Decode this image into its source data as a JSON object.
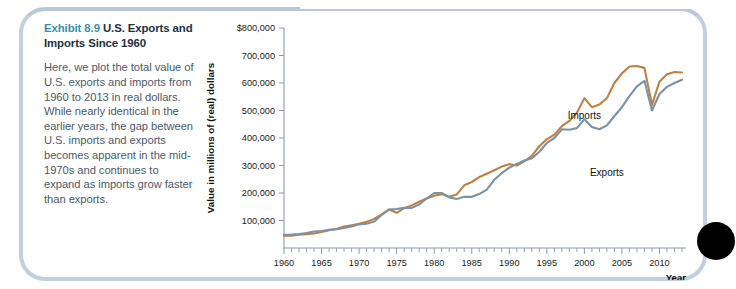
{
  "caption": {
    "exhibit_label": "Exhibit 8.9",
    "title": "U.S. Exports and Imports Since 1960",
    "body": "Here, we plot the total value of U.S. exports and imports from 1960 to 2013 in real dollars. While nearly identical in the earlier years, the gap between U.S. imports and exports becomes apparent in the mid-1970s and continues to expand as imports grow faster than exports.",
    "accent_color": "#3a8fa8"
  },
  "chart_data": {
    "type": "line",
    "title": "",
    "xlabel": "Year",
    "ylabel": "Value in millions of (real) dollars",
    "xlim": [
      1960,
      2013
    ],
    "ylim": [
      0,
      800000
    ],
    "grid": false,
    "legend": "inline-labels",
    "ytick_labels": [
      "$800,000",
      "700,000",
      "600,000",
      "500,000",
      "400,000",
      "300,000",
      "200,000",
      "100,000"
    ],
    "ytick_values": [
      800000,
      700000,
      600000,
      500000,
      400000,
      300000,
      200000,
      100000
    ],
    "xtick_labels": [
      "1960",
      "1965",
      "1970",
      "1975",
      "1980",
      "1985",
      "1990",
      "1995",
      "2000",
      "2005",
      "2010"
    ],
    "xtick_values": [
      1960,
      1965,
      1970,
      1975,
      1980,
      1985,
      1990,
      1995,
      2000,
      2005,
      2010
    ],
    "x": [
      1960,
      1961,
      1962,
      1963,
      1964,
      1965,
      1966,
      1967,
      1968,
      1969,
      1970,
      1971,
      1972,
      1973,
      1974,
      1975,
      1976,
      1977,
      1978,
      1979,
      1980,
      1981,
      1982,
      1983,
      1984,
      1985,
      1986,
      1987,
      1988,
      1989,
      1990,
      1991,
      1992,
      1993,
      1994,
      1995,
      1996,
      1997,
      1998,
      1999,
      2000,
      2001,
      2002,
      2003,
      2004,
      2005,
      2006,
      2007,
      2008,
      2009,
      2010,
      2011,
      2012,
      2013
    ],
    "series": [
      {
        "name": "Imports",
        "color": "#c2803f",
        "label_position": {
          "x": 2000,
          "y": 470000
        },
        "values": [
          45000,
          45000,
          48000,
          50000,
          53000,
          58000,
          65000,
          69000,
          78000,
          83000,
          88000,
          95000,
          106000,
          122000,
          140000,
          128000,
          145000,
          155000,
          168000,
          180000,
          190000,
          196000,
          186000,
          195000,
          228000,
          240000,
          258000,
          270000,
          283000,
          296000,
          305000,
          300000,
          315000,
          335000,
          370000,
          396000,
          412000,
          443000,
          462000,
          492000,
          545000,
          512000,
          522000,
          545000,
          600000,
          635000,
          660000,
          662000,
          655000,
          520000,
          605000,
          632000,
          640000,
          638000
        ]
      },
      {
        "name": "Exports",
        "color": "#7b92a8",
        "label_position": {
          "x": 2003,
          "y": 262000
        },
        "values": [
          48000,
          49000,
          51000,
          54000,
          60000,
          62000,
          66000,
          68000,
          73000,
          78000,
          86000,
          88000,
          96000,
          120000,
          140000,
          142000,
          146000,
          146000,
          158000,
          180000,
          200000,
          200000,
          184000,
          178000,
          186000,
          186000,
          196000,
          212000,
          248000,
          272000,
          292000,
          306000,
          318000,
          326000,
          350000,
          382000,
          400000,
          432000,
          430000,
          436000,
          468000,
          440000,
          432000,
          446000,
          480000,
          512000,
          552000,
          588000,
          608000,
          500000,
          560000,
          586000,
          600000,
          612000
        ]
      }
    ],
    "annotations": [
      {
        "text": "Imports",
        "series": "Imports"
      },
      {
        "text": "Exports",
        "series": "Exports"
      }
    ]
  },
  "decor": {
    "dot_color": "#000000",
    "frame_color": "#c3cfdd"
  }
}
